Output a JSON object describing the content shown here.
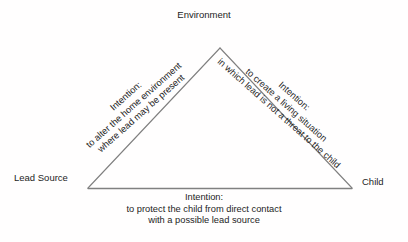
{
  "diagram": {
    "type": "triangle-relationship-diagram",
    "colors": {
      "background": "#fffefe",
      "stroke": "#808080",
      "text": "#1d1d1d"
    },
    "vertices": [
      {
        "id": "environment",
        "label": "Environment",
        "position": "top"
      },
      {
        "id": "lead-source",
        "label": "Lead Source",
        "position": "bottom-left"
      },
      {
        "id": "child",
        "label": "Child",
        "position": "bottom-right"
      }
    ],
    "edges": [
      {
        "id": "left-edge",
        "from": "lead-source",
        "to": "environment",
        "rotation_deg": -41.5,
        "lines": [
          "Intention:",
          "to alter the home environment",
          "where lead may be present"
        ]
      },
      {
        "id": "right-edge",
        "from": "environment",
        "to": "child",
        "rotation_deg": 41.5,
        "lines": [
          "Intention:",
          "to create a living situation",
          "in which lead is not a threat to the child"
        ]
      },
      {
        "id": "bottom-edge",
        "from": "lead-source",
        "to": "child",
        "rotation_deg": 0,
        "lines": [
          "Intention:",
          "to protect the child from direct contact",
          "with a possible lead source"
        ]
      }
    ]
  }
}
